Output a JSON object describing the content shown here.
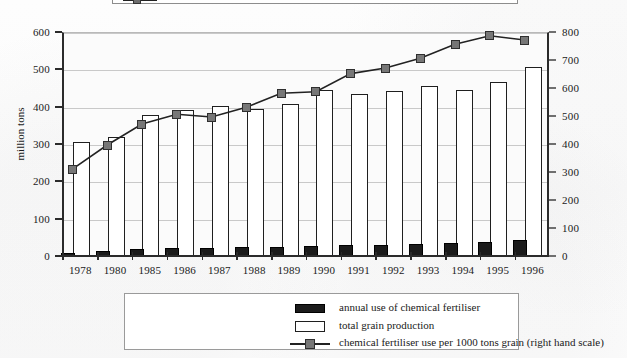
{
  "chart_data": {
    "type": "bar",
    "title": "",
    "subtitle": "",
    "xlabel": "",
    "ylabel": "million tons",
    "y2label": "",
    "ylim": [
      0,
      600
    ],
    "y2lim": [
      0,
      800
    ],
    "grid": true,
    "legend_position": "bottom",
    "categories": [
      "1978",
      "1980",
      "1985",
      "1986",
      "1987",
      "1988",
      "1989",
      "1990",
      "1991",
      "1992",
      "1993",
      "1994",
      "1995",
      "1996"
    ],
    "y_ticks": [
      "0",
      "100",
      "200",
      "300",
      "400",
      "500",
      "600"
    ],
    "y2_ticks": [
      "0",
      "100",
      "200",
      "300",
      "400",
      "500",
      "600",
      "700",
      "800"
    ],
    "series": [
      {
        "name": "annual use of chemical fertiliser",
        "type": "bar",
        "axis": "left",
        "unit": "million tons",
        "color": "#1b1b1b",
        "values": [
          9,
          13,
          19,
          21,
          21,
          24,
          24,
          26,
          29,
          30,
          32,
          35,
          38,
          42
        ]
      },
      {
        "name": "total grain production",
        "type": "bar",
        "axis": "left",
        "unit": "million tons",
        "color": "#ffffff",
        "values": [
          305,
          320,
          379,
          392,
          403,
          395,
          408,
          446,
          435,
          442,
          456,
          445,
          466,
          505
        ]
      },
      {
        "name": "chemical fertiliser use per 1000 tons grain (right hand scale)",
        "type": "line",
        "axis": "right",
        "unit": "tons per 1000 tons grain",
        "color": "#777777",
        "values": [
          314,
          400,
          475,
          510,
          500,
          535,
          585,
          590,
          655,
          675,
          710,
          760,
          790,
          775
        ]
      }
    ]
  },
  "axes": {
    "left_title": "million tons"
  },
  "legend": {
    "items": [
      {
        "label": "annual use of chemical fertiliser",
        "swatch": "filled-black-square-icon"
      },
      {
        "label": "total grain production",
        "swatch": "outlined-white-square-icon"
      },
      {
        "label": "chemical fertiliser use per 1000 tons grain (right hand scale)",
        "swatch": "line-with-grey-square-marker-icon"
      }
    ]
  }
}
